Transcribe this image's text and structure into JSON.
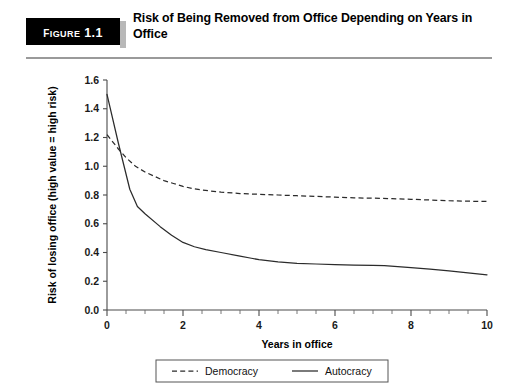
{
  "figure": {
    "badge_label": "Figure 1.1",
    "title": "Risk of Being Removed from Office Depending on Years in Office"
  },
  "chart_data": {
    "type": "line",
    "title": "Risk of Being Removed from Office Depending on Years in Office",
    "xlabel": "Years in office",
    "ylabel": "Risk of losing office (high value = high risk)",
    "xlim": [
      0,
      10
    ],
    "ylim": [
      0.0,
      1.6
    ],
    "xticks": [
      0,
      2,
      4,
      6,
      8,
      10
    ],
    "xtick_labels": [
      "0",
      "2",
      "4",
      "6",
      "8",
      "10"
    ],
    "xtick_minor_step": 0.5,
    "yticks": [
      0.0,
      0.2,
      0.4,
      0.6,
      0.8,
      1.0,
      1.2,
      1.4,
      1.6
    ],
    "ytick_labels": [
      "0.0",
      "0.2",
      "0.4",
      "0.6",
      "0.8",
      "1.0",
      "1.2",
      "1.4",
      "1.6"
    ],
    "grid": false,
    "legend_position": "bottom-center",
    "series": [
      {
        "name": "Democracy",
        "style": "dashed",
        "color": "#2b2b2b",
        "x": [
          0.0,
          0.15,
          0.3,
          0.5,
          0.75,
          1.0,
          1.25,
          1.5,
          1.75,
          2.0,
          2.25,
          2.5,
          3.0,
          3.5,
          4.0,
          4.5,
          5.0,
          5.5,
          6.0,
          6.5,
          7.0,
          7.5,
          8.0,
          8.5,
          9.0,
          9.5,
          10.0
        ],
        "y": [
          1.22,
          1.17,
          1.12,
          1.06,
          1.0,
          0.96,
          0.93,
          0.9,
          0.88,
          0.86,
          0.845,
          0.835,
          0.82,
          0.81,
          0.805,
          0.8,
          0.795,
          0.79,
          0.785,
          0.78,
          0.778,
          0.775,
          0.77,
          0.765,
          0.76,
          0.757,
          0.755
        ]
      },
      {
        "name": "Autocracy",
        "style": "solid",
        "color": "#2b2b2b",
        "x": [
          0.0,
          0.3,
          0.6,
          0.8,
          1.0,
          1.4,
          1.7,
          2.0,
          2.3,
          2.6,
          3.0,
          3.5,
          3.8,
          4.0,
          4.5,
          5.0,
          5.5,
          6.0,
          6.5,
          7.0,
          7.3,
          8.0,
          8.5,
          9.0,
          9.5,
          10.0
        ],
        "y": [
          1.5,
          1.16,
          0.84,
          0.72,
          0.67,
          0.58,
          0.52,
          0.47,
          0.44,
          0.42,
          0.4,
          0.375,
          0.36,
          0.35,
          0.335,
          0.325,
          0.32,
          0.315,
          0.312,
          0.31,
          0.308,
          0.295,
          0.285,
          0.272,
          0.258,
          0.245
        ]
      }
    ]
  },
  "legend": {
    "items": [
      {
        "label": "Democracy",
        "style": "dashed"
      },
      {
        "label": "Autocracy",
        "style": "solid"
      }
    ]
  }
}
